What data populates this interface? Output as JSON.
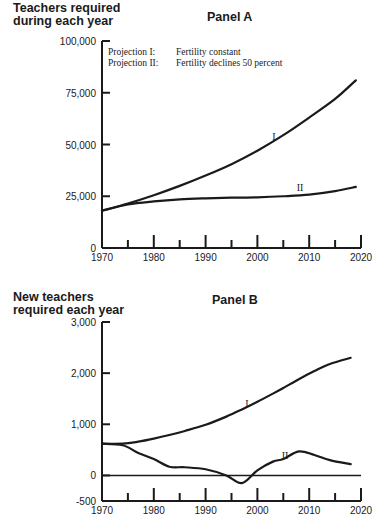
{
  "chart_data": [
    {
      "type": "line",
      "panel": "Panel A",
      "title": "Panel A",
      "ylabel": "Teachers required during each year",
      "xlabel": "",
      "xlim": [
        1970,
        2020
      ],
      "ylim": [
        0,
        100000
      ],
      "x_ticks": [
        "1970",
        "1980",
        "1990",
        "2000",
        "2010",
        "2020"
      ],
      "y_ticks": [
        "0",
        "25,000",
        "50,000",
        "75,000",
        "100,000"
      ],
      "grid": false,
      "legend": [
        {
          "key": "Projection I:",
          "text": "Fertility constant"
        },
        {
          "key": "Projection II:",
          "text": "Fertility declines 50 percent"
        }
      ],
      "x": [
        1970,
        1975,
        1980,
        1985,
        1990,
        1995,
        2000,
        2005,
        2010,
        2015,
        2019
      ],
      "series": [
        {
          "name": "I",
          "values": [
            18000,
            21500,
            25500,
            30000,
            35000,
            40500,
            47000,
            54500,
            63000,
            72000,
            81000
          ]
        },
        {
          "name": "II",
          "values": [
            18000,
            21000,
            22500,
            23500,
            24000,
            24300,
            24500,
            25000,
            25800,
            27500,
            29500
          ]
        }
      ]
    },
    {
      "type": "line",
      "panel": "Panel B",
      "title": "Panel B",
      "ylabel": "New teachers required each year",
      "xlabel": "",
      "xlim": [
        1970,
        2020
      ],
      "ylim": [
        -500,
        3000
      ],
      "x_ticks": [
        "1970",
        "1980",
        "1990",
        "2000",
        "2010",
        "2020"
      ],
      "y_ticks": [
        "-500",
        "0",
        "1,000",
        "2,000",
        "3,000"
      ],
      "grid": false,
      "x": [
        1970,
        1974,
        1977,
        1980,
        1983,
        1986,
        1990,
        1994,
        1997,
        2000,
        2003,
        2005,
        2008,
        2011,
        2014,
        2018
      ],
      "series": [
        {
          "name": "I",
          "values": [
            620,
            620,
            660,
            720,
            790,
            870,
            990,
            1150,
            1290,
            1440,
            1600,
            1710,
            1880,
            2040,
            2180,
            2300
          ]
        },
        {
          "name": "II",
          "values": [
            620,
            590,
            440,
            320,
            170,
            160,
            120,
            0,
            -150,
            100,
            270,
            320,
            470,
            400,
            300,
            220
          ]
        }
      ]
    }
  ],
  "panelA": {
    "ylabel_line1": "Teachers required",
    "ylabel_line2": "during each year",
    "title": "Panel A",
    "legend_key1": "Projection I:",
    "legend_text1": "Fertility constant",
    "legend_key2": "Projection II:",
    "legend_text2": "Fertility declines 50 percent",
    "curve_label_1": "I",
    "curve_label_2": "II"
  },
  "panelB": {
    "ylabel_line1": "New teachers",
    "ylabel_line2": "required each year",
    "title": "Panel B",
    "curve_label_1": "I",
    "curve_label_2": "II"
  }
}
